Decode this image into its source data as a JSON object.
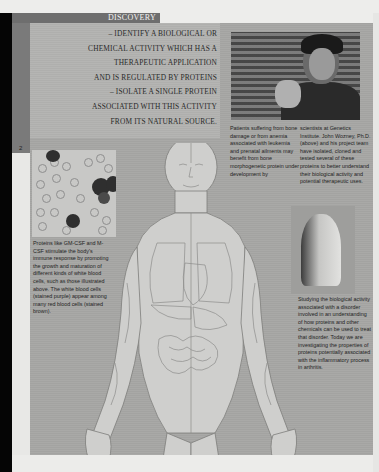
{
  "section": {
    "label": "DISCOVERY",
    "page_number": "2"
  },
  "steps": [
    "– IDENTIFY A BIOLOGICAL OR",
    "CHEMICAL ACTIVITY WHICH HAS A",
    "THERAPEUTIC APPLICATION",
    "AND IS REGULATED BY PROTEINS",
    "– ISOLATE A SINGLE PROTEIN",
    "ASSOCIATED WITH THIS ACTIVITY",
    "FROM ITS NATURAL SOURCE."
  ],
  "photo_caption": {
    "col1": "Patients suffering from bone damage or from anemia associated with leukemia and prenatal ailments may benefit from bone morphogenetic protein under development by",
    "col2": "scientists at Genetics Institute. John Wozney, Ph.D. (above) and his project team have isolated, cloned and tested several of these proteins to better understand their biological activity and potential therapeutic uses."
  },
  "blood_caption": "Proteins like GM-CSF and M-CSF stimulate the body's immune response by promoting the growth and maturation of different kinds of white blood cells, such as those illustrated above. The white blood cells (stained purple) appear among many red blood cells (stained brown).",
  "hand_caption": "Studying the biological activity associated with a disorder involved in an understanding of how proteins and other chemicals can be used to treat that disorder. Today we are investigating the properties of proteins potentially associated with the inflammatory process in arthritis.",
  "images": {
    "scientist_photo": "photo-of-scientist",
    "blood_cells": "micrograph-of-blood-cells",
    "arthritic_hand": "photo-of-arthritic-hand",
    "anatomy_figure": "anatomical-illustration-of-human-body"
  },
  "colors": {
    "panel": "#a7a7a5",
    "section_tab": "#6e6e6e",
    "edge": "#050505",
    "paper": "#ededeb"
  }
}
